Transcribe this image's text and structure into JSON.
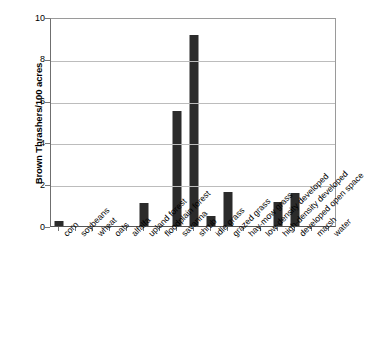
{
  "chart_data": {
    "type": "bar",
    "title": "",
    "xlabel": "",
    "ylabel": "Brown Thrashers/100 acres",
    "ylim": [
      0,
      10
    ],
    "yticks": [
      0,
      2,
      4,
      6,
      8,
      10
    ],
    "grid": true,
    "legend": null,
    "bar_color": "#2b2b2b",
    "categories": [
      "corn",
      "soybeans",
      "wheat",
      "oats",
      "alfalfa",
      "upland forest",
      "floodplain forest",
      "savanna",
      "shrub",
      "idle grass",
      "grazed grass",
      "hay-mow grass",
      "low-density developed",
      "high-density developed",
      "developed open space",
      "marsh",
      "water"
    ],
    "values": [
      0.25,
      0,
      0,
      0,
      0,
      1.1,
      0,
      5.5,
      9.15,
      0.5,
      1.65,
      0,
      0,
      1.15,
      1.6,
      0,
      0
    ]
  }
}
